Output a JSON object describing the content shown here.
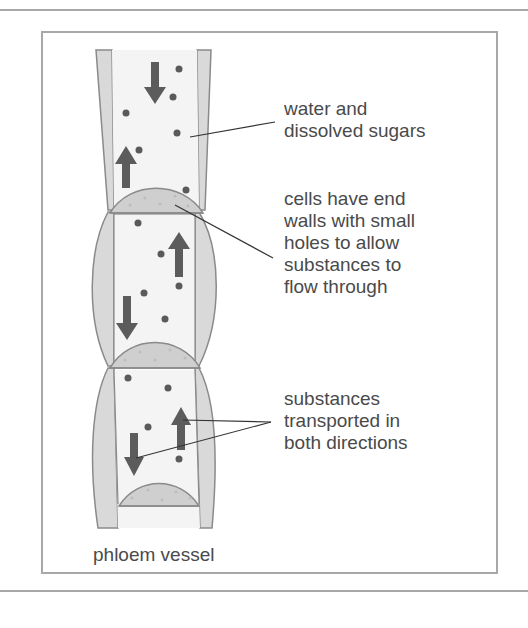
{
  "figure": {
    "caption": "phloem vessel",
    "labels": {
      "sugars": [
        "water and",
        "dissolved sugars"
      ],
      "end_walls": [
        "cells have end",
        "walls with small",
        "holes to allow",
        "substances to",
        "flow through"
      ],
      "directions": [
        "substances",
        "transported in",
        "both directions"
      ]
    },
    "colors": {
      "wall_fill": "#d9d9d9",
      "wall_stroke": "#8a8a8a",
      "lumen_fill": "#f4f4f4",
      "sieve_plate_fill": "#cfcfcf",
      "arrow": "#5c5c5c",
      "dot": "#5a5a5a",
      "frame": "#a8a8a8",
      "text": "#4a4a4a"
    }
  }
}
